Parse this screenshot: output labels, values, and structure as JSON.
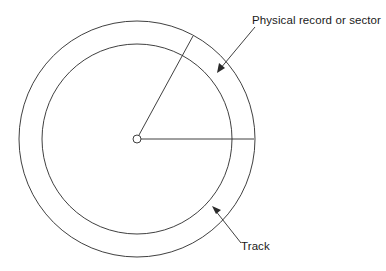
{
  "diagram": {
    "type": "disk-track-sector",
    "colors": {
      "line": "#2a2a2a",
      "background": "#ffffff"
    },
    "center": {
      "x": 137,
      "y": 139,
      "hub_radius": 4
    },
    "outer_circle_radius": 118,
    "inner_circle_radius": 95,
    "labels": {
      "sector": "Physical record or sector",
      "track": "Track"
    }
  }
}
